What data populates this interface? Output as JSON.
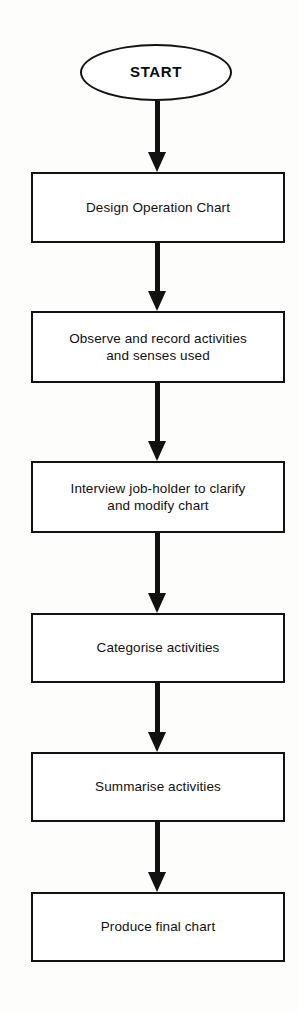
{
  "diagram": {
    "type": "flowchart",
    "orientation": "vertical-top-to-bottom",
    "background_color": "#fdfdfb",
    "line_color": "#121212",
    "fill_color": "#ffffff",
    "nodes": [
      {
        "id": "start",
        "shape": "oval",
        "label": "START",
        "x": 80,
        "y": 44,
        "width": 152,
        "height": 57
      },
      {
        "id": "design-operation-chart",
        "shape": "rectangle",
        "label": "Design Operation Chart",
        "x": 31,
        "y": 172,
        "width": 254,
        "height": 71
      },
      {
        "id": "observe-record-activities",
        "shape": "rectangle",
        "label": "Observe and record activities\nand senses used",
        "x": 31,
        "y": 311,
        "width": 254,
        "height": 72
      },
      {
        "id": "interview-job-holder",
        "shape": "rectangle",
        "label": "Interview job-holder to clarify\nand modify chart",
        "x": 31,
        "y": 461,
        "width": 254,
        "height": 72
      },
      {
        "id": "categorise-activities",
        "shape": "rectangle",
        "label": "Categorise activities",
        "x": 31,
        "y": 613,
        "width": 254,
        "height": 70
      },
      {
        "id": "summarise-activities",
        "shape": "rectangle",
        "label": "Summarise activities",
        "x": 31,
        "y": 752,
        "width": 254,
        "height": 70
      },
      {
        "id": "produce-final-chart",
        "shape": "rectangle",
        "label": "Produce final chart",
        "x": 31,
        "y": 892,
        "width": 254,
        "height": 70
      }
    ],
    "connectors": [
      {
        "id": "arrow-start-to-design",
        "from": "start",
        "to": "design-operation-chart",
        "x": 147,
        "y": 101,
        "length": 71,
        "direction": "down"
      },
      {
        "id": "arrow-design-to-observe",
        "from": "design-operation-chart",
        "to": "observe-record-activities",
        "x": 147,
        "y": 243,
        "length": 68,
        "direction": "down"
      },
      {
        "id": "arrow-observe-to-interview",
        "from": "observe-record-activities",
        "to": "interview-job-holder",
        "x": 147,
        "y": 383,
        "length": 78,
        "direction": "down"
      },
      {
        "id": "arrow-interview-to-categorise",
        "from": "interview-job-holder",
        "to": "categorise-activities",
        "x": 147,
        "y": 533,
        "length": 80,
        "direction": "down"
      },
      {
        "id": "arrow-categorise-to-summarise",
        "from": "categorise-activities",
        "to": "summarise-activities",
        "x": 147,
        "y": 683,
        "length": 69,
        "direction": "down"
      },
      {
        "id": "arrow-summarise-to-produce",
        "from": "summarise-activities",
        "to": "produce-final-chart",
        "x": 147,
        "y": 822,
        "length": 70,
        "direction": "down"
      }
    ]
  }
}
